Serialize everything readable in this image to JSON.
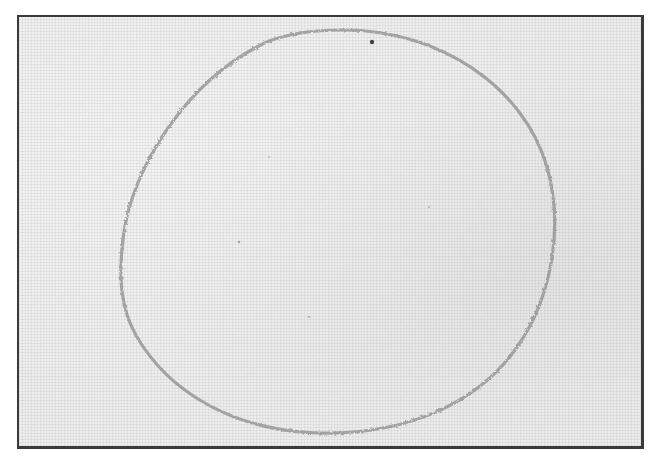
{
  "image": {
    "description": "Photograph of a hand-drawn pencil circle on woven linen fabric, enclosed in a dark frame border",
    "subject": "drawn-circle",
    "background": "linen-fabric",
    "colors": {
      "fabric": "#f3f3f3",
      "weave": "#9a9a9a",
      "pencil_stroke": "#8c8c8c",
      "frame_border": "#3a3a3a"
    }
  }
}
